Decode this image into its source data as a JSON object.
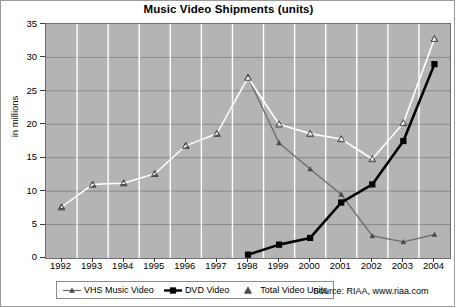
{
  "chart_data": {
    "type": "line",
    "title": "Music Video Shipments (units)",
    "xlabel": "",
    "ylabel": "in millions",
    "categories": [
      "1992",
      "1993",
      "1994",
      "1995",
      "1996",
      "1997",
      "1998",
      "1999",
      "2000",
      "2001",
      "2002",
      "2003",
      "2004"
    ],
    "x": [
      1992,
      1993,
      1994,
      1995,
      1996,
      1997,
      1998,
      1999,
      2000,
      2001,
      2002,
      2003,
      2004
    ],
    "ylim": [
      0,
      35
    ],
    "yticks": [
      0,
      5,
      10,
      15,
      20,
      25,
      30,
      35
    ],
    "grid": true,
    "legend_position": "bottom-left",
    "series": [
      {
        "name": "VHS Music Video",
        "color": "#6b6b6b",
        "marker": "triangle-small",
        "values": [
          7.6,
          11.0,
          11.2,
          12.6,
          16.8,
          18.6,
          27.0,
          17.2,
          13.3,
          9.5,
          3.3,
          2.4,
          3.5
        ]
      },
      {
        "name": "DVD Video",
        "color": "#000000",
        "marker": "square",
        "values": [
          null,
          null,
          null,
          null,
          null,
          null,
          0.5,
          2.0,
          3.0,
          8.3,
          11.0,
          17.5,
          29.0
        ]
      },
      {
        "name": "Total Video Units",
        "color": "#ffffff",
        "marker": "triangle-open",
        "values": [
          7.6,
          11.0,
          11.2,
          12.6,
          16.8,
          18.6,
          27.0,
          20.0,
          18.6,
          17.8,
          14.8,
          20.2,
          32.8
        ]
      }
    ]
  },
  "header": {
    "title": "Music Video Shipments (units)"
  },
  "axes": {
    "y_label": "in millions",
    "y_ticks": [
      "35",
      "30",
      "25",
      "20",
      "15",
      "10",
      "5",
      "0"
    ],
    "x_ticks": [
      "1992",
      "1993",
      "1994",
      "1995",
      "1996",
      "1997",
      "1998",
      "1999",
      "2000",
      "2001",
      "2002",
      "2003",
      "2004"
    ]
  },
  "legend": {
    "items": [
      {
        "label": "VHS Music Video",
        "color": "#6b6b6b"
      },
      {
        "label": "DVD Video",
        "color": "#000000"
      },
      {
        "label": "Total Video Units",
        "color": "#ffffff"
      }
    ]
  },
  "footer": {
    "source": "Source: RIAA, www.riaa.com"
  }
}
